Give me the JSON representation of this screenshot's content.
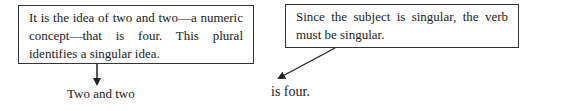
{
  "annotations": [
    {
      "id": "note-1",
      "text": "It is the idea of two and two—a numeric concept—that is four. This plural identifies a singular idea.",
      "points_to": "subject"
    },
    {
      "id": "note-2",
      "text": "Since the subject is singular, the verb must be singular.",
      "points_to": "predicate"
    }
  ],
  "sentence": {
    "subject": "Two and two",
    "predicate": "is four."
  },
  "colors": {
    "line": "#333333",
    "text": "#222222",
    "background": "#ffffff"
  }
}
